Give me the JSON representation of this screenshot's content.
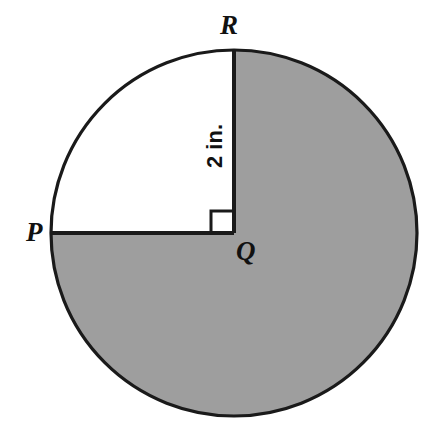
{
  "figure": {
    "type": "circle-sector-diagram",
    "background_color": "#ffffff",
    "outline_color": "#1a1a1a",
    "shaded_color": "#9e9e9e",
    "unshaded_color": "#ffffff",
    "circle": {
      "center_x": 234,
      "center_y": 233,
      "radius": 183,
      "stroke_width": 3
    },
    "shaded_sector": {
      "start_angle_deg": 90,
      "end_angle_deg": 360,
      "sweep_deg": 270,
      "description": "shaded major sector from R clockwise around to P"
    },
    "unshaded_sector": {
      "start_angle_deg": 90,
      "end_angle_deg": 180,
      "sweep_deg": 90,
      "description": "white quarter sector PQR"
    },
    "radii": [
      {
        "name": "QP",
        "from": "Q",
        "to": "P",
        "direction": "left",
        "stroke_width": 4
      },
      {
        "name": "QR",
        "from": "Q",
        "to": "R",
        "direction": "up",
        "stroke_width": 4
      }
    ],
    "right_angle_marker": {
      "at_vertex": "Q",
      "size": 21,
      "stroke_width": 3,
      "placed_in": "unshaded_sector"
    }
  },
  "labels": {
    "point_r": "R",
    "point_p": "P",
    "point_q": "Q",
    "measurement": "2 in."
  },
  "measurement": {
    "value": "2",
    "unit": "in.",
    "text": "2 in.",
    "applies_to": "QR",
    "rotation_deg": -90
  }
}
